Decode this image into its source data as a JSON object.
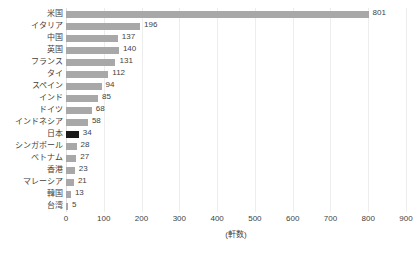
{
  "chart_data": {
    "type": "bar",
    "orientation": "horizontal",
    "title": "",
    "subtitle": "",
    "xlabel": "(軒数)",
    "ylabel": "",
    "xlim": [
      0,
      900
    ],
    "xticks": [
      0,
      100,
      200,
      300,
      400,
      500,
      600,
      700,
      800,
      900
    ],
    "xtick_labels": [
      "0",
      "100",
      "200",
      "300",
      "400",
      "500",
      "600",
      "700",
      "800",
      "900"
    ],
    "grid": "vertical",
    "legend": "none",
    "categories": [
      "米国",
      "イタリア",
      "中国",
      "英国",
      "フランス",
      "タイ",
      "スペイン",
      "インド",
      "ドイツ",
      "インドネシア",
      "日本",
      "シンガポール",
      "ベトナム",
      "香港",
      "マレーシア",
      "韓国",
      "台湾"
    ],
    "values": [
      801,
      196,
      137,
      140,
      131,
      112,
      94,
      85,
      68,
      58,
      34,
      28,
      27,
      23,
      21,
      13,
      5
    ],
    "value_labels": [
      "801",
      "196",
      "137",
      "140",
      "131",
      "112",
      "94",
      "85",
      "68",
      "58",
      "34",
      "28",
      "27",
      "23",
      "21",
      "13",
      "5"
    ],
    "highlight_category": "日本",
    "colors": {
      "bar": "#a8a8a8",
      "bar_highlight": "#1a1a1a",
      "gridline": "#ededed",
      "text": "#3f3f3f",
      "background": "#ffffff"
    }
  }
}
